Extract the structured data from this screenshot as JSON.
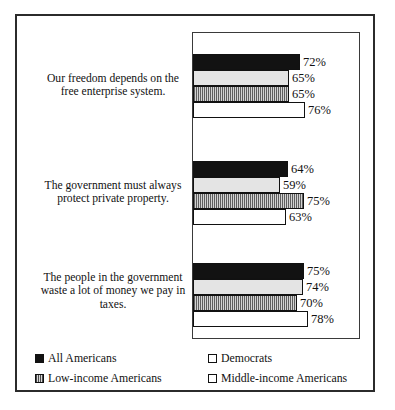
{
  "chart_data": {
    "type": "bar",
    "orientation": "horizontal",
    "title": "",
    "xlabel": "",
    "ylabel": "",
    "xlim": [
      0,
      100
    ],
    "grid": false,
    "legend_position": "bottom",
    "value_suffix": "%",
    "categories": [
      "Our freedom depends on the free enterprise system.",
      "The government must always protect private property.",
      "The people in the government waste a lot of money we pay in taxes."
    ],
    "series": [
      {
        "name": "All Americans",
        "pattern": "solid-black",
        "values": [
          72,
          64,
          75
        ]
      },
      {
        "name": "Democrats",
        "pattern": "light-dotted",
        "values": [
          65,
          59,
          74
        ]
      },
      {
        "name": "Low-income Americans",
        "pattern": "vertical-stripes",
        "values": [
          65,
          75,
          70
        ]
      },
      {
        "name": "Middle-income Americans",
        "pattern": "white-open",
        "values": [
          76,
          63,
          78
        ]
      }
    ],
    "data_labels": [
      [
        "72%",
        "65%",
        "65%",
        "76%"
      ],
      [
        "64%",
        "59%",
        "75%",
        "63%"
      ],
      [
        "75%",
        "74%",
        "70%",
        "78%"
      ]
    ]
  },
  "legend": {
    "items": [
      {
        "label": "All Americans"
      },
      {
        "label": "Democrats"
      },
      {
        "label": "Low-income Americans"
      },
      {
        "label": "Middle-income Americans"
      }
    ]
  }
}
